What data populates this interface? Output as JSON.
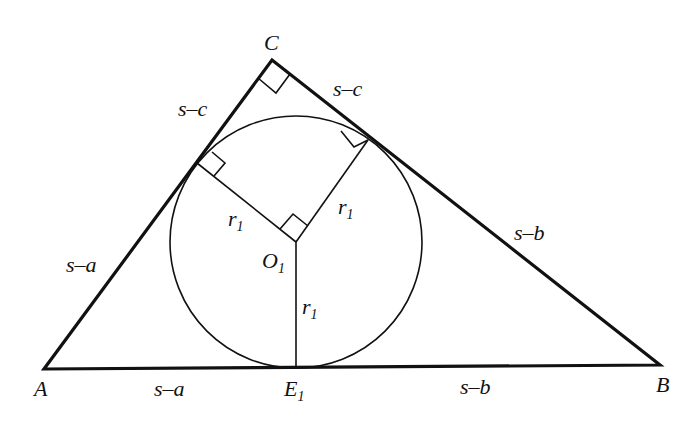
{
  "vertices": {
    "A": {
      "label": "A",
      "x": 44,
      "y": 369
    },
    "B": {
      "label": "B",
      "x": 660,
      "y": 365
    },
    "C": {
      "label": "C",
      "x": 272,
      "y": 60
    }
  },
  "incircle": {
    "center_label": "O",
    "center_sub": "1",
    "cx": 296,
    "cy": 242,
    "r": 126
  },
  "tangent_point": {
    "label": "E",
    "sub": "1"
  },
  "radius_labels": [
    {
      "text": "r",
      "sub": "1"
    },
    {
      "text": "r",
      "sub": "1"
    },
    {
      "text": "r",
      "sub": "1"
    }
  ],
  "segment_labels": {
    "AC_upper": "s–c",
    "CB_upper": "s–c",
    "AC_lower": "s–a",
    "CB_lower": "s–b",
    "AB_left": "s–a",
    "AB_right": "s–b"
  },
  "colors": {
    "stroke": "#111111",
    "background": "#ffffff"
  }
}
